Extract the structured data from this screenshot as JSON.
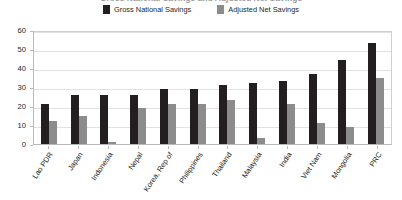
{
  "chart_data": {
    "type": "bar",
    "title": "Gross National Savings and Adjusted Net Savings",
    "xlabel": "",
    "ylabel": "",
    "ylim": [
      0,
      60
    ],
    "yticks": [
      0,
      10,
      20,
      30,
      40,
      50,
      60
    ],
    "grid": true,
    "legend_position": "top-center",
    "categories": [
      "Lao PDR",
      "Japan",
      "Indonesia",
      "Nepal",
      "Korea, Rep of",
      "Philippines",
      "Thailand",
      "Malaysia",
      "India",
      "Viet Nam",
      "Mongolia",
      "PRC"
    ],
    "series": [
      {
        "name": "Gross National Savings",
        "color": "#231f20",
        "values": [
          21,
          26,
          26,
          26,
          29,
          29,
          31,
          32,
          33,
          37,
          44,
          53
        ]
      },
      {
        "name": "Adjusted Net Savings",
        "color": "#8c8c8c",
        "values": [
          12,
          15,
          1,
          19,
          21,
          21,
          23,
          3,
          21,
          11,
          9,
          35
        ]
      }
    ]
  },
  "legend": {
    "items": [
      {
        "label": "Gross National Savings",
        "color": "#231f20"
      },
      {
        "label": "Adjusted Net Savings",
        "color": "#8c8c8c"
      }
    ]
  }
}
